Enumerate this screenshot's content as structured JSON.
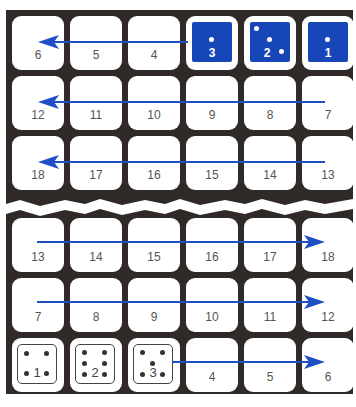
{
  "diagram": {
    "colors": {
      "board": "#2f2927",
      "cell": "#ffffff",
      "arrow": "#1f4fc4",
      "blue_die": "#1646b8",
      "number_text": "#555555"
    },
    "top_section": {
      "rows": [
        {
          "cells": [
            "6",
            "5",
            "4",
            "3",
            "2",
            "1"
          ],
          "arrow": "right-to-left",
          "dice_cells": [
            {
              "label": "3",
              "pips": 1,
              "style": "blue"
            },
            {
              "label": "2",
              "pips": 3,
              "style": "blue"
            },
            {
              "label": "1",
              "pips": 1,
              "style": "blue"
            }
          ]
        },
        {
          "cells": [
            "12",
            "11",
            "10",
            "9",
            "8",
            "7"
          ],
          "arrow": "right-to-left"
        },
        {
          "cells": [
            "18",
            "17",
            "16",
            "15",
            "14",
            "13"
          ],
          "arrow": "right-to-left"
        }
      ]
    },
    "bottom_section": {
      "rows": [
        {
          "cells": [
            "13",
            "14",
            "15",
            "16",
            "17",
            "18"
          ],
          "arrow": "left-to-right"
        },
        {
          "cells": [
            "7",
            "8",
            "9",
            "10",
            "11",
            "12"
          ],
          "arrow": "left-to-right"
        },
        {
          "cells": [
            "1",
            "2",
            "3",
            "4",
            "5",
            "6"
          ],
          "arrow": "left-to-right",
          "dice_cells": [
            {
              "label": "1",
              "pips": 4,
              "style": "white"
            },
            {
              "label": "2",
              "pips": 6,
              "style": "white"
            },
            {
              "label": "3",
              "pips": 5,
              "style": "white"
            }
          ]
        }
      ]
    }
  }
}
